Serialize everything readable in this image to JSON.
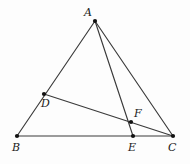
{
  "figure": {
    "type": "geometry-diagram",
    "width": 190,
    "height": 164,
    "background_color": "#fdfdfd",
    "stroke_color": "#3a3a3a",
    "vertex_color": "#111111",
    "label_color": "#1a1a1a",
    "points": [
      {
        "id": "A",
        "label": "A",
        "x": 95,
        "y": 21,
        "label_x": 84,
        "label_y": 7
      },
      {
        "id": "B",
        "label": "B",
        "x": 17,
        "y": 136,
        "label_x": 12,
        "label_y": 142
      },
      {
        "id": "C",
        "label": "C",
        "x": 173,
        "y": 136,
        "label_x": 168,
        "label_y": 142
      },
      {
        "id": "D",
        "label": "D",
        "x": 44,
        "y": 94,
        "label_x": 41,
        "label_y": 98
      },
      {
        "id": "E",
        "label": "E",
        "x": 133,
        "y": 136,
        "label_x": 128,
        "label_y": 142
      },
      {
        "id": "F",
        "label": "F",
        "x": 131,
        "y": 122,
        "label_x": 134,
        "label_y": 108
      }
    ],
    "segments": [
      {
        "id": "AB",
        "from": "A",
        "to": "B"
      },
      {
        "id": "AC",
        "from": "A",
        "to": "C"
      },
      {
        "id": "AE",
        "from": "A",
        "to": "E"
      },
      {
        "id": "BC",
        "from": "B",
        "to": "C"
      },
      {
        "id": "DC",
        "from": "D",
        "to": "C"
      }
    ]
  }
}
